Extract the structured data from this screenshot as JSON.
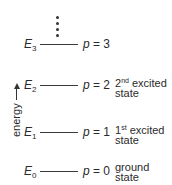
{
  "diagram": {
    "axis_label": "energy",
    "levels": [
      {
        "symbol": "E",
        "sub": "3",
        "p_var": "p",
        "p_eq": " = 3",
        "ord": "",
        "ord_sup": "",
        "state_line1": "",
        "state_line2": ""
      },
      {
        "symbol": "E",
        "sub": "2",
        "p_var": "p",
        "p_eq": " = 2",
        "ord": "2",
        "ord_sup": "nd",
        "state_line1": " excited",
        "state_line2": "state"
      },
      {
        "symbol": "E",
        "sub": "1",
        "p_var": "p",
        "p_eq": " = 1",
        "ord": "1",
        "ord_sup": "st",
        "state_line1": " excited",
        "state_line2": "state"
      },
      {
        "symbol": "E",
        "sub": "0",
        "p_var": "p",
        "p_eq": " = 0",
        "ord": "",
        "ord_sup": "",
        "state_line1": "ground",
        "state_line2": "state"
      }
    ],
    "continuation": "vertical-dots"
  }
}
